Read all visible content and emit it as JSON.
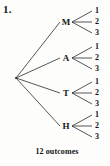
{
  "problem": {
    "number_label": "1."
  },
  "caption": {
    "text": "12 outcomes"
  },
  "diagram": {
    "type": "tree-diagram",
    "root": {
      "x": 16,
      "y": 78
    },
    "line_color": "#2b2b2b",
    "text_color": "#141414",
    "background_color": "#fdfdfc",
    "branches": [
      {
        "label": "M",
        "x": 66,
        "y": 22,
        "leaves": [
          {
            "label": "1",
            "x": 97,
            "y": 11
          },
          {
            "label": "2",
            "x": 97,
            "y": 22
          },
          {
            "label": "3",
            "x": 97,
            "y": 33
          }
        ]
      },
      {
        "label": "A",
        "x": 66,
        "y": 58,
        "leaves": [
          {
            "label": "1",
            "x": 97,
            "y": 47
          },
          {
            "label": "2",
            "x": 97,
            "y": 58
          },
          {
            "label": "3",
            "x": 97,
            "y": 69
          }
        ]
      },
      {
        "label": "T",
        "x": 66,
        "y": 93,
        "leaves": [
          {
            "label": "1",
            "x": 97,
            "y": 82
          },
          {
            "label": "2",
            "x": 97,
            "y": 93
          },
          {
            "label": "3",
            "x": 97,
            "y": 104
          }
        ]
      },
      {
        "label": "H",
        "x": 66,
        "y": 126,
        "leaves": [
          {
            "label": "1",
            "x": 97,
            "y": 115
          },
          {
            "label": "2",
            "x": 97,
            "y": 126
          },
          {
            "label": "3",
            "x": 97,
            "y": 137
          }
        ]
      }
    ]
  }
}
